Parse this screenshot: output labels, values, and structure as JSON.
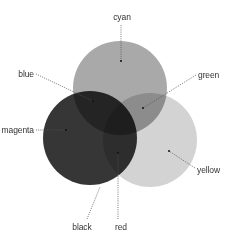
{
  "diagram": {
    "type": "venn-color-mixing",
    "circles": [
      {
        "id": "cyan",
        "label": "cyan",
        "cx": 120,
        "cy": 88,
        "r": 47,
        "fill": "#a9a9a9"
      },
      {
        "id": "magenta",
        "label": "magenta",
        "cx": 90,
        "cy": 138,
        "r": 47,
        "fill": "#363636"
      },
      {
        "id": "yellow",
        "label": "yellow",
        "cx": 150,
        "cy": 140,
        "r": 47,
        "fill": "#d3d3d3"
      }
    ],
    "labels": {
      "cyan": "cyan",
      "blue": "blue",
      "green": "green",
      "magenta": "magenta",
      "yellow": "yellow",
      "black": "black",
      "red": "red"
    },
    "label_color": "#333333",
    "leader_color": "#555555"
  }
}
